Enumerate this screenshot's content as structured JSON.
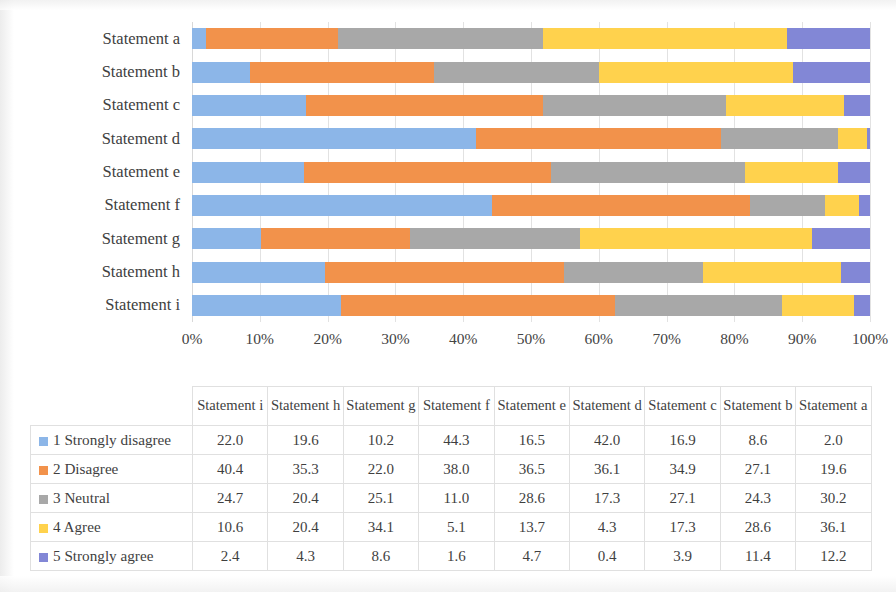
{
  "chart_data": {
    "type": "bar",
    "subtype": "stacked-horizontal-100-percent",
    "title": "",
    "xlabel": "",
    "ylabel": "",
    "xlim": [
      0,
      100
    ],
    "grid": true,
    "legend_position": "table-row-labels",
    "categories": [
      "Statement a",
      "Statement b",
      "Statement c",
      "Statement d",
      "Statement e",
      "Statement f",
      "Statement g",
      "Statement h",
      "Statement i"
    ],
    "xticklabels": [
      "0%",
      "10%",
      "20%",
      "30%",
      "40%",
      "50%",
      "60%",
      "70%",
      "80%",
      "90%",
      "100%"
    ],
    "xticks": [
      0,
      10,
      20,
      30,
      40,
      50,
      60,
      70,
      80,
      90,
      100
    ],
    "series": [
      {
        "name": "1 Strongly disagree",
        "color": "#8CB6E8",
        "values": [
          2.0,
          8.6,
          16.9,
          42.0,
          16.5,
          44.3,
          10.2,
          19.6,
          22.0
        ]
      },
      {
        "name": "2 Disagree",
        "color": "#F2924B",
        "values": [
          19.6,
          27.1,
          34.9,
          36.1,
          36.5,
          38.0,
          22.0,
          35.3,
          40.4
        ]
      },
      {
        "name": "3 Neutral",
        "color": "#A8A8A8",
        "values": [
          30.2,
          24.3,
          27.1,
          17.3,
          28.6,
          11.0,
          25.1,
          20.4,
          24.7
        ]
      },
      {
        "name": "4 Agree",
        "color": "#FFD24D",
        "values": [
          36.1,
          28.6,
          17.3,
          4.3,
          13.7,
          5.1,
          34.1,
          20.4,
          10.6
        ]
      },
      {
        "name": "5 Strongly agree",
        "color": "#8287D6",
        "values": [
          12.2,
          11.4,
          3.9,
          0.4,
          4.7,
          1.6,
          8.6,
          4.3,
          2.4
        ]
      }
    ]
  },
  "table": {
    "corner_label": "",
    "column_headers": [
      "Statement i",
      "Statement h",
      "Statement g",
      "Statement f",
      "Statement e",
      "Statement d",
      "Statement c",
      "Statement b",
      "Statement a"
    ],
    "rows": [
      {
        "label": "1 Strongly disagree",
        "swatch": "#8CB6E8",
        "values": [
          "22.0",
          "19.6",
          "10.2",
          "44.3",
          "16.5",
          "42.0",
          "16.9",
          "8.6",
          "2.0"
        ]
      },
      {
        "label": "2 Disagree",
        "swatch": "#F2924B",
        "values": [
          "40.4",
          "35.3",
          "22.0",
          "38.0",
          "36.5",
          "36.1",
          "34.9",
          "27.1",
          "19.6"
        ]
      },
      {
        "label": "3 Neutral",
        "swatch": "#A8A8A8",
        "values": [
          "24.7",
          "20.4",
          "25.1",
          "11.0",
          "28.6",
          "17.3",
          "27.1",
          "24.3",
          "30.2"
        ]
      },
      {
        "label": "4 Agree",
        "swatch": "#FFD24D",
        "values": [
          "10.6",
          "20.4",
          "34.1",
          "5.1",
          "13.7",
          "4.3",
          "17.3",
          "28.6",
          "36.1"
        ]
      },
      {
        "label": "5 Strongly agree",
        "swatch": "#8287D6",
        "values": [
          "2.4",
          "4.3",
          "8.6",
          "1.6",
          "4.7",
          "0.4",
          "3.9",
          "11.4",
          "12.2"
        ]
      }
    ]
  }
}
